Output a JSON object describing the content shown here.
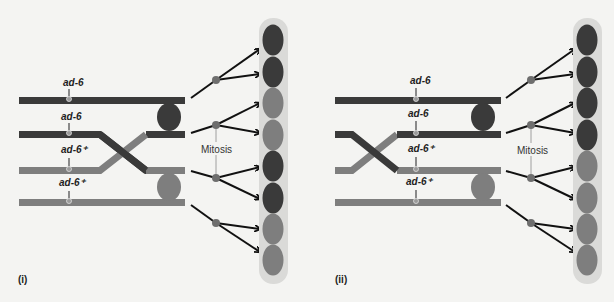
{
  "colors": {
    "background": "#f4f4f2",
    "dark": "#3a3a3a",
    "light": "#7e7e7e",
    "ascus": "#dadad8",
    "arrow": "#111111",
    "mitosis_dot": "#6e6e6e",
    "marker_stem": "#8a8a8a"
  },
  "panels": [
    {
      "id": "i",
      "label": "(i)",
      "offset_x": 0,
      "chromatids": [
        {
          "label": "ad-6",
          "color": "dark"
        },
        {
          "label": "ad-6",
          "color": "dark"
        },
        {
          "label": "ad-6⁺",
          "color": "light"
        },
        {
          "label": "ad-6⁺",
          "color": "light"
        }
      ],
      "crossover_x": [
        100,
        146
      ],
      "mitosis_label": "Mitosis",
      "spores": [
        "dark",
        "dark",
        "light",
        "light",
        "dark",
        "dark",
        "light",
        "light"
      ]
    },
    {
      "id": "ii",
      "label": "(ii)",
      "offset_x": 314,
      "chromatids": [
        {
          "label": "ad-6",
          "color": "dark"
        },
        {
          "label": "ad-6",
          "color": "dark"
        },
        {
          "label": "ad-6⁺",
          "color": "light"
        },
        {
          "label": "ad-6⁺",
          "color": "light"
        }
      ],
      "crossover_x": [
        38,
        83
      ],
      "mitosis_label": "Mitosis",
      "spores": [
        "dark",
        "dark",
        "dark",
        "dark",
        "light",
        "light",
        "light",
        "light"
      ]
    }
  ]
}
